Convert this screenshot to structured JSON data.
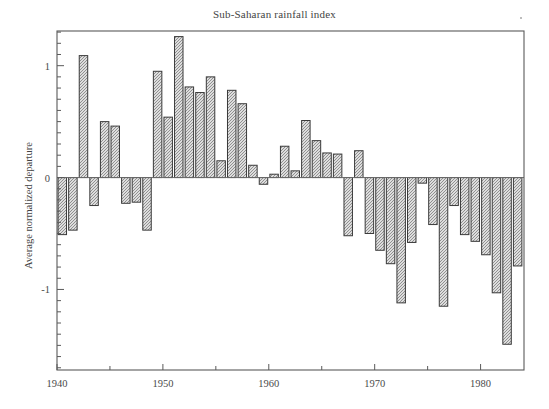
{
  "chart_data": {
    "type": "bar",
    "title": "Sub-Saharan rainfall index",
    "xlabel": "",
    "ylabel": "Average normalized departure",
    "xlim": [
      1940,
      1984.1
    ],
    "ylim": [
      -1.72,
      1.31
    ],
    "grid": false,
    "legend": null,
    "x_major_ticks": [
      1940,
      1950,
      1960,
      1970,
      1980
    ],
    "x_major_tick_labels": [
      "1940",
      "1950",
      "1960",
      "1970",
      "1980"
    ],
    "x_minor_ticks": [
      1945,
      1955,
      1965,
      1975
    ],
    "y_major_ticks": [
      1,
      0,
      -1
    ],
    "y_major_tick_labels": [
      "1",
      "0",
      "-1"
    ],
    "y_minor_tick_step": 0.1,
    "bar_color": "#d8d8d8",
    "bar_edge_color": "#3a3a3a",
    "bar_hatch": "crosshatch",
    "axis_color": "#5a5a5a",
    "categories": [
      1940,
      1941,
      1942,
      1943,
      1944,
      1945,
      1946,
      1947,
      1948,
      1949,
      1950,
      1951,
      1952,
      1953,
      1954,
      1955,
      1956,
      1957,
      1958,
      1959,
      1960,
      1961,
      1962,
      1963,
      1964,
      1965,
      1966,
      1967,
      1968,
      1969,
      1970,
      1971,
      1972,
      1973,
      1974,
      1975,
      1976,
      1977,
      1978,
      1979,
      1980,
      1981,
      1982,
      1983
    ],
    "values": [
      -0.51,
      -0.47,
      1.09,
      -0.25,
      0.5,
      0.46,
      -0.23,
      -0.22,
      -0.47,
      0.95,
      0.54,
      1.26,
      0.81,
      0.76,
      0.9,
      0.15,
      0.78,
      0.66,
      0.11,
      -0.06,
      0.03,
      0.28,
      0.06,
      0.51,
      0.33,
      0.22,
      0.21,
      -0.52,
      0.24,
      -0.5,
      -0.65,
      -0.77,
      -1.12,
      -0.58,
      -0.05,
      -0.42,
      -1.15,
      -0.25,
      -0.51,
      -0.57,
      -0.69,
      -1.03,
      -1.49,
      -0.79
    ]
  }
}
